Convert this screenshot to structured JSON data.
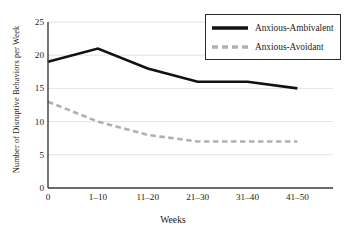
{
  "chart_data": {
    "type": "line",
    "title": "",
    "xlabel": "Weeks",
    "ylabel": "Number of Disruptive Behaviors per Week",
    "categories": [
      "0",
      "1–10",
      "11–20",
      "21–30",
      "31–40",
      "41–50"
    ],
    "yticks": [
      0,
      5,
      10,
      15,
      20,
      25
    ],
    "ytick_labels": [
      "0",
      "5",
      "10",
      "15",
      "20",
      "25"
    ],
    "ylim": [
      0,
      25
    ],
    "grid": true,
    "legend_position": "top-right",
    "series": [
      {
        "name": "Anxious-Ambivalent",
        "values": [
          19,
          21,
          18,
          16,
          16,
          15
        ],
        "style": "solid",
        "color": "#111111",
        "width": 2.6
      },
      {
        "name": "Anxious-Avoidant",
        "values": [
          13,
          10,
          8,
          7,
          7,
          7
        ],
        "style": "dashed",
        "color": "#b0b0b0",
        "width": 2.6
      }
    ]
  },
  "axis": {
    "line_color": "#3a3a3a",
    "grid_color": "#e3e3e3"
  }
}
